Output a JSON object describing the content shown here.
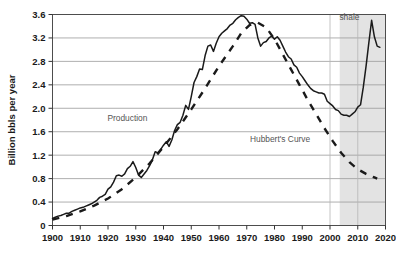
{
  "chart_data": {
    "type": "line",
    "title": "",
    "xlabel": "",
    "ylabel": "Billion bbls per year",
    "xlim": [
      1900,
      2020
    ],
    "ylim": [
      0,
      3.6
    ],
    "xticks": [
      1900,
      1910,
      1920,
      1930,
      1940,
      1950,
      1960,
      1970,
      1980,
      1990,
      2000,
      2010,
      2020
    ],
    "yticks": [
      0,
      0.4,
      0.8,
      1.2,
      1.6,
      2.0,
      2.4,
      2.8,
      3.2,
      3.6
    ],
    "ytick_labels": [
      "0",
      "0.4",
      "0.8",
      "1.2",
      "1.6",
      "2.0",
      "2.4",
      "2.8",
      "3.2",
      "3.6"
    ],
    "xtick_labels": [
      "1900",
      "1910",
      "1920",
      "1930",
      "1940",
      "1950",
      "1960",
      "1970",
      "1980",
      "1990",
      "2000",
      "2010",
      "2020"
    ],
    "grid": "horizontal",
    "legend": "none",
    "annotations": [
      {
        "text": "Production",
        "x": 1927,
        "y": 1.78,
        "color": "#555555"
      },
      {
        "text": "Hubbert's Curve",
        "x": 1982,
        "y": 1.42,
        "color": "#555555"
      },
      {
        "text": "shale",
        "x": 2007,
        "y": 3.5,
        "color": "#555555"
      }
    ],
    "shaded_regions": [
      {
        "name": "shale",
        "x0": 2003.5,
        "x1": 2020,
        "color": "#e3e3e3"
      }
    ],
    "series": [
      {
        "name": "Production",
        "style": "solid",
        "color": "#1a1a1a",
        "points": [
          [
            1900,
            0.12
          ],
          [
            1901,
            0.14
          ],
          [
            1902,
            0.16
          ],
          [
            1903,
            0.17
          ],
          [
            1904,
            0.19
          ],
          [
            1905,
            0.21
          ],
          [
            1906,
            0.21
          ],
          [
            1907,
            0.24
          ],
          [
            1908,
            0.26
          ],
          [
            1909,
            0.28
          ],
          [
            1910,
            0.3
          ],
          [
            1911,
            0.31
          ],
          [
            1912,
            0.33
          ],
          [
            1913,
            0.35
          ],
          [
            1914,
            0.37
          ],
          [
            1915,
            0.4
          ],
          [
            1916,
            0.43
          ],
          [
            1917,
            0.48
          ],
          [
            1918,
            0.5
          ],
          [
            1919,
            0.53
          ],
          [
            1920,
            0.62
          ],
          [
            1921,
            0.66
          ],
          [
            1922,
            0.74
          ],
          [
            1923,
            0.85
          ],
          [
            1924,
            0.86
          ],
          [
            1925,
            0.84
          ],
          [
            1926,
            0.88
          ],
          [
            1927,
            0.97
          ],
          [
            1928,
            1.01
          ],
          [
            1929,
            1.09
          ],
          [
            1930,
            0.99
          ],
          [
            1931,
            0.86
          ],
          [
            1932,
            0.82
          ],
          [
            1933,
            0.88
          ],
          [
            1934,
            0.94
          ],
          [
            1935,
            1.02
          ],
          [
            1936,
            1.12
          ],
          [
            1937,
            1.26
          ],
          [
            1938,
            1.24
          ],
          [
            1939,
            1.3
          ],
          [
            1940,
            1.37
          ],
          [
            1941,
            1.43
          ],
          [
            1942,
            1.35
          ],
          [
            1943,
            1.46
          ],
          [
            1944,
            1.62
          ],
          [
            1945,
            1.72
          ],
          [
            1946,
            1.76
          ],
          [
            1947,
            1.88
          ],
          [
            1948,
            2.05
          ],
          [
            1949,
            1.98
          ],
          [
            1950,
            2.2
          ],
          [
            1951,
            2.44
          ],
          [
            1952,
            2.54
          ],
          [
            1953,
            2.67
          ],
          [
            1954,
            2.66
          ],
          [
            1955,
            2.9
          ],
          [
            1956,
            3.06
          ],
          [
            1957,
            3.08
          ],
          [
            1958,
            2.97
          ],
          [
            1959,
            3.11
          ],
          [
            1960,
            3.22
          ],
          [
            1961,
            3.28
          ],
          [
            1962,
            3.32
          ],
          [
            1963,
            3.36
          ],
          [
            1964,
            3.42
          ],
          [
            1965,
            3.45
          ],
          [
            1966,
            3.51
          ],
          [
            1967,
            3.55
          ],
          [
            1968,
            3.58
          ],
          [
            1969,
            3.57
          ],
          [
            1970,
            3.52
          ],
          [
            1971,
            3.45
          ],
          [
            1972,
            3.46
          ],
          [
            1973,
            3.43
          ],
          [
            1974,
            3.2
          ],
          [
            1975,
            3.06
          ],
          [
            1976,
            3.12
          ],
          [
            1977,
            3.14
          ],
          [
            1978,
            3.2
          ],
          [
            1979,
            3.23
          ],
          [
            1980,
            3.18
          ],
          [
            1981,
            3.22
          ],
          [
            1982,
            3.16
          ],
          [
            1983,
            3.06
          ],
          [
            1984,
            2.96
          ],
          [
            1985,
            2.88
          ],
          [
            1986,
            2.84
          ],
          [
            1987,
            2.74
          ],
          [
            1988,
            2.7
          ],
          [
            1989,
            2.6
          ],
          [
            1990,
            2.54
          ],
          [
            1991,
            2.47
          ],
          [
            1992,
            2.4
          ],
          [
            1993,
            2.34
          ],
          [
            1994,
            2.3
          ],
          [
            1995,
            2.28
          ],
          [
            1996,
            2.26
          ],
          [
            1997,
            2.26
          ],
          [
            1998,
            2.24
          ],
          [
            1999,
            2.12
          ],
          [
            2000,
            2.08
          ],
          [
            2001,
            2.04
          ],
          [
            2002,
            1.98
          ],
          [
            2003,
            1.96
          ],
          [
            2004,
            1.9
          ],
          [
            2005,
            1.88
          ],
          [
            2006,
            1.88
          ],
          [
            2007,
            1.86
          ],
          [
            2008,
            1.9
          ],
          [
            2009,
            1.94
          ],
          [
            2010,
            2.02
          ],
          [
            2011,
            2.06
          ],
          [
            2012,
            2.36
          ],
          [
            2013,
            2.72
          ],
          [
            2014,
            3.12
          ],
          [
            2015,
            3.5
          ],
          [
            2016,
            3.22
          ],
          [
            2017,
            3.06
          ],
          [
            2018,
            3.04
          ]
        ]
      },
      {
        "name": "Hubbert's Curve",
        "style": "dashed",
        "color": "#1a1a1a",
        "points": [
          [
            1900,
            0.1
          ],
          [
            1905,
            0.16
          ],
          [
            1910,
            0.24
          ],
          [
            1915,
            0.34
          ],
          [
            1920,
            0.46
          ],
          [
            1925,
            0.62
          ],
          [
            1930,
            0.82
          ],
          [
            1935,
            1.06
          ],
          [
            1940,
            1.34
          ],
          [
            1945,
            1.64
          ],
          [
            1950,
            1.98
          ],
          [
            1955,
            2.34
          ],
          [
            1960,
            2.72
          ],
          [
            1965,
            3.06
          ],
          [
            1968,
            3.28
          ],
          [
            1971,
            3.42
          ],
          [
            1974,
            3.46
          ],
          [
            1977,
            3.38
          ],
          [
            1980,
            3.18
          ],
          [
            1983,
            2.92
          ],
          [
            1986,
            2.66
          ],
          [
            1989,
            2.4
          ],
          [
            1992,
            2.14
          ],
          [
            1995,
            1.9
          ],
          [
            1998,
            1.66
          ],
          [
            2001,
            1.44
          ],
          [
            2004,
            1.24
          ],
          [
            2007,
            1.08
          ],
          [
            2010,
            0.96
          ],
          [
            2013,
            0.88
          ],
          [
            2016,
            0.82
          ],
          [
            2017,
            0.8
          ]
        ]
      }
    ]
  },
  "axis": {
    "y_title": "Billion bbls per year"
  }
}
